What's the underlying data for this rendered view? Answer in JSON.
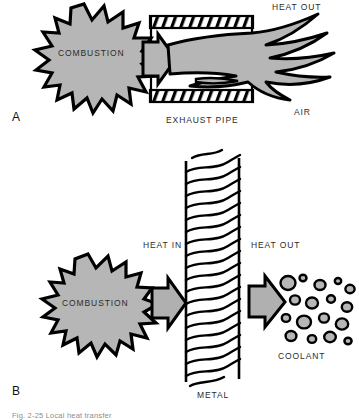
{
  "figure": {
    "caption": "Fig. 2-25  Local heat transfer"
  },
  "palette": {
    "fill_gray": "#b6b6b6",
    "arrow_gray": "#b0b0b0",
    "outline": "#000000",
    "background": "#ffffff",
    "text": "#2b2b2b"
  },
  "panels": [
    {
      "id": "A",
      "letter": "A",
      "labels": {
        "combustion": "COMBUSTION",
        "heat_out": "HEAT OUT",
        "exhaust_pipe": "EXHAUST PIPE",
        "air": "AIR"
      }
    },
    {
      "id": "B",
      "letter": "B",
      "labels": {
        "combustion": "COMBUSTION",
        "heat_in": "HEAT IN",
        "heat_out": "HEAT OUT",
        "metal": "METAL",
        "coolant": "COOLANT"
      }
    }
  ]
}
